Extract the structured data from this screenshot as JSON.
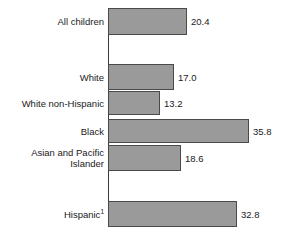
{
  "chart_data": {
    "type": "bar",
    "orientation": "horizontal",
    "title": "",
    "xlabel": "",
    "ylabel": "",
    "grid": false,
    "legend": false,
    "xlim": [
      0,
      40
    ],
    "categories": [
      "All children",
      "White",
      "White non-Hispanic",
      "Black",
      "Asian and Pacific\nIslander",
      "Hispanic"
    ],
    "values": [
      20.4,
      17.0,
      13.2,
      35.8,
      18.6,
      32.8
    ],
    "value_labels": [
      "20.4",
      "17.0",
      "13.2",
      "35.8",
      "18.6",
      "32.8"
    ],
    "footnote_markers": [
      "",
      "",
      "",
      "",
      "",
      "1"
    ],
    "bar_color": "#9a9a9a",
    "bar_edge_color": "#4a4a4a",
    "axis_color": "#3a3a3a",
    "background_color": "#ffffff"
  },
  "bars": [
    {
      "label": "All children",
      "footnote": "",
      "value": 20.4,
      "value_label": "20.4",
      "top": 8,
      "height": 27,
      "width": 79
    },
    {
      "label": "White",
      "footnote": "",
      "value": 17.0,
      "value_label": "17.0",
      "top": 64,
      "height": 26,
      "width": 66
    },
    {
      "label": "White non-Hispanic",
      "footnote": "",
      "value": 13.2,
      "value_label": "13.2",
      "top": 91,
      "height": 24,
      "width": 52
    },
    {
      "label": "Black",
      "footnote": "",
      "value": 35.8,
      "value_label": "35.8",
      "top": 119,
      "height": 24,
      "width": 141
    },
    {
      "label": "Asian and Pacific\nIslander",
      "footnote": "",
      "value": 18.6,
      "value_label": "18.6",
      "top": 145,
      "height": 26,
      "width": 73
    },
    {
      "label": "Hispanic",
      "footnote": "1",
      "value": 32.8,
      "value_label": "32.8",
      "top": 201,
      "height": 26,
      "width": 129
    }
  ]
}
